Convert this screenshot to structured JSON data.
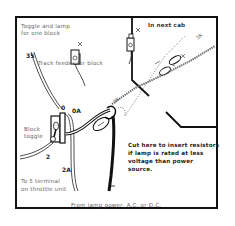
{
  "diagram": {
    "title_label": {
      "line1": "Toggle and lamp",
      "line2": "for one block"
    },
    "inset_label": "In next cab",
    "track_feeder_label": "Track feeder for block",
    "block_toggle_label": {
      "line1": "Block",
      "line2": "toggle"
    },
    "throttle_label": {
      "line1": "To 5 terminal",
      "line2": "on throttle unit"
    },
    "cut_note": {
      "line1": "Cut here to insert resistors",
      "line2": "if lamp is rated at less",
      "line3": "voltage than power",
      "line4": "source."
    },
    "power_label": "From lamp power, A.C. or D.C.",
    "terminals": {
      "t35": "35",
      "t0": "0",
      "t0a": "0A",
      "t2": "2",
      "t2a": "2A"
    },
    "cable_labels": {
      "c1": "3K",
      "c2": "3K",
      "c3": "3K"
    },
    "colors": {
      "line": "#111111",
      "text": "#666666",
      "border": "#111111"
    }
  }
}
